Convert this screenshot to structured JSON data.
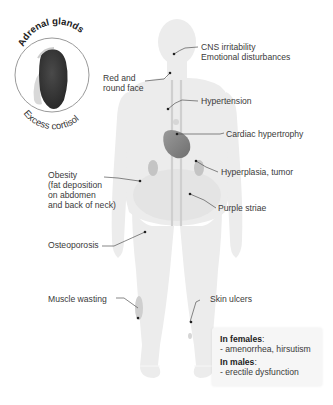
{
  "inset": {
    "title": "Adrenal glands",
    "caption": "Excess cortisol",
    "gland_color": "#3a3a3a",
    "circle_stroke": "#999999"
  },
  "labels": {
    "cns": [
      "CNS irritability",
      "Emotional disturbances"
    ],
    "face": [
      "Red and",
      "round face"
    ],
    "hypertension": "Hypertension",
    "cardiac": "Cardiac hypertrophy",
    "obesity": [
      "Obesity",
      "(fat deposition",
      "on abdomen",
      "and back of neck)"
    ],
    "hyperplasia": "Hyperplasia, tumor",
    "striae": "Purple striae",
    "osteoporosis": "Osteoporosis",
    "muscle": "Muscle wasting",
    "skin": "Skin ulcers"
  },
  "info_box": {
    "females_header": "In females",
    "females_colon": ":",
    "females_text": "- amenorrhea, hirsutism",
    "males_header": "In males",
    "males_colon": ":",
    "males_text": "- erectile dysfunction"
  },
  "colors": {
    "body": "#ececec",
    "body_shade": "#e2e2e2",
    "organ": "#bdbdbd",
    "heart": "#8a8a8a",
    "leader": "#444444"
  }
}
